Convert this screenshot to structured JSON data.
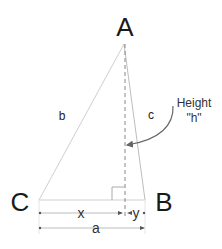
{
  "diagram": {
    "type": "triangle-altitude",
    "vertices": [
      {
        "id": "A",
        "label": "A"
      },
      {
        "id": "B",
        "label": "B"
      },
      {
        "id": "C",
        "label": "C"
      }
    ],
    "sides": [
      {
        "id": "b",
        "label": "b",
        "from": "C",
        "to": "A"
      },
      {
        "id": "c",
        "label": "c",
        "from": "A",
        "to": "B"
      }
    ],
    "altitude": {
      "label_line1": "Height",
      "label_line2": "\"h\""
    },
    "dimensions": [
      {
        "id": "x",
        "label": "x"
      },
      {
        "id": "y",
        "label": "y"
      },
      {
        "id": "a",
        "label": "a"
      }
    ],
    "colors": {
      "side_line": "#cccccc",
      "altitude_line": "#888888",
      "arrow": "#666666",
      "text": "#1a1a1a"
    }
  }
}
